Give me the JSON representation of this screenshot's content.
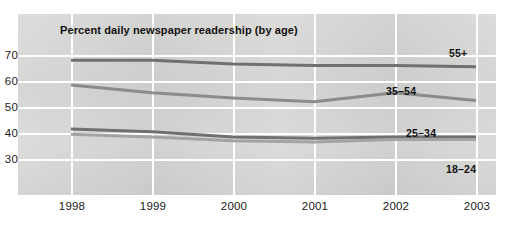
{
  "figure": {
    "title": "Percent daily newspaper readership (by age)",
    "panel_color": "#d6d6d4",
    "grid_color": "#ffffff",
    "background": "#ffffff"
  },
  "chart_data": {
    "type": "line",
    "title": "Percent daily newspaper readership (by age)",
    "xlabel": "",
    "ylabel": "",
    "x": [
      "1998",
      "1999",
      "2000",
      "2001",
      "2002",
      "2003"
    ],
    "categories": [
      "1998",
      "1999",
      "2000",
      "2001",
      "2002",
      "2003"
    ],
    "xticklabels": [
      "1998",
      "1999",
      "2000",
      "2001",
      "2002",
      "2003"
    ],
    "yticks": [
      30,
      40,
      50,
      60,
      70
    ],
    "yticklabels": [
      "30",
      "40",
      "50",
      "60",
      "70"
    ],
    "ylim": [
      24,
      76
    ],
    "grid": true,
    "grid_axis": "both",
    "legend": "inline-end-labels",
    "legend_position": "right-of-line-ends",
    "series": [
      {
        "name": "55+",
        "label": "55+",
        "color": "#6f7072",
        "values": [
          68,
          68,
          66.5,
          66,
          66,
          65.5
        ]
      },
      {
        "name": "35-54",
        "label": "35–54",
        "color": "#8a8b8d",
        "values": [
          58.5,
          55.5,
          53.5,
          52,
          55.5,
          52.5
        ]
      },
      {
        "name": "25-34",
        "label": "25–34",
        "color": "#6f7072",
        "values": [
          41.5,
          40.5,
          38.5,
          38,
          38.5,
          38.5
        ]
      },
      {
        "name": "18-24",
        "label": "18–24",
        "color": "#a2a3a4",
        "values": [
          39.5,
          38.5,
          37,
          36.5,
          37.5,
          37.5
        ]
      }
    ]
  }
}
